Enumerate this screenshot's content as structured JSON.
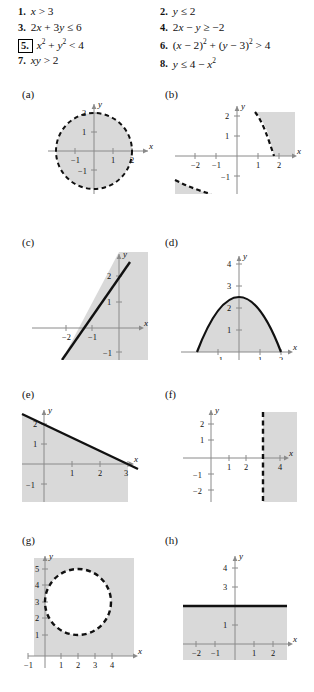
{
  "exercises": {
    "left": [
      {
        "num": "1.",
        "boxed": false,
        "text": "x > 3",
        "html": "<i class='ital'>x</i> &gt; 3"
      },
      {
        "num": "3.",
        "boxed": false,
        "text": "2x + 3y ≤ 6",
        "html": "2<i class='ital'>x</i> + 3<i class='ital'>y</i> ≤ 6"
      },
      {
        "num": "5.",
        "boxed": true,
        "text": "x² + y² < 4",
        "html": "<i class='ital'>x</i><sup>2</sup> + <i class='ital'>y</i><sup>2</sup> &lt; 4"
      },
      {
        "num": "7.",
        "boxed": false,
        "text": "xy > 2",
        "html": "<i class='ital'>xy</i> &gt; 2"
      }
    ],
    "right": [
      {
        "num": "2.",
        "boxed": false,
        "text": "y ≤ 2",
        "html": "<i class='ital'>y</i> ≤ 2"
      },
      {
        "num": "4.",
        "boxed": false,
        "text": "2x − y ≥ −2",
        "html": "2<i class='ital'>x</i> − <i class='ital'>y</i> ≥ −2"
      },
      {
        "num": "6.",
        "boxed": false,
        "text": "(x − 2)² + (y − 3)² > 4",
        "html": "(<i class='ital'>x</i> − 2)<sup>2</sup> + (<i class='ital'>y</i> − 3)<sup>2</sup> &gt; 4"
      },
      {
        "num": "8.",
        "boxed": false,
        "text": "y ≤ 4 − x²",
        "html": "<i class='ital'>y</i> ≤ 4 − <i class='ital'>x</i><sup>2</sup>"
      }
    ]
  },
  "axis_names": {
    "x": "x",
    "y": "y"
  },
  "colors": {
    "shade": "#d9d9d9",
    "curve": "#111111",
    "axis": "#8a8a8a",
    "text": "#111111"
  },
  "panels": [
    {
      "id": "a",
      "label": "(a)",
      "matches_exercise": "5",
      "chart_data": {
        "type": "region",
        "relation": "x^2 + y^2 < 4",
        "boundary": "dashed",
        "shape": "circle",
        "center": [
          0,
          0
        ],
        "radius": 2,
        "shaded": "interior",
        "xticks": [
          -1,
          1,
          2
        ],
        "yticks": [
          -1,
          1,
          2
        ],
        "xlabel": "x",
        "ylabel": "y"
      }
    },
    {
      "id": "b",
      "label": "(b)",
      "matches_exercise": "7",
      "chart_data": {
        "type": "region",
        "relation": "xy > 2",
        "boundary": "dashed",
        "shape": "hyperbola",
        "shaded": "above-right branch in Q1 and below-left branch in Q3",
        "xticks": [
          -2,
          -1,
          1,
          2
        ],
        "yticks": [
          -1,
          1,
          2
        ],
        "xlabel": "x",
        "ylabel": "y"
      }
    },
    {
      "id": "c",
      "label": "(c)",
      "matches_exercise": "4",
      "chart_data": {
        "type": "region",
        "relation": "2x - y >= -2",
        "boundary": "solid",
        "shape": "line",
        "line_points": [
          [
            -1,
            0
          ],
          [
            0,
            2
          ]
        ],
        "slope": 2,
        "intercept": 2,
        "shaded": "right of line",
        "xticks": [
          -2,
          -1
        ],
        "yticks": [
          -1,
          1,
          2
        ],
        "xlabel": "x",
        "ylabel": "y"
      }
    },
    {
      "id": "d",
      "label": "(d)",
      "matches_exercise": "8",
      "chart_data": {
        "type": "region",
        "relation": "y <= 4 - x^2",
        "boundary": "solid",
        "shape": "parabola",
        "vertex": [
          0,
          4
        ],
        "roots": [
          -2,
          2
        ],
        "shaded": "interior below parabola",
        "xticks": [
          -1,
          1,
          2
        ],
        "yticks": [
          1,
          2,
          3,
          4
        ],
        "xlabel": "x",
        "ylabel": "y"
      }
    },
    {
      "id": "e",
      "label": "(e)",
      "matches_exercise": "3",
      "chart_data": {
        "type": "region",
        "relation": "2x + 3y <= 6",
        "boundary": "solid",
        "shape": "line",
        "line_points": [
          [
            0,
            2
          ],
          [
            3,
            0
          ]
        ],
        "slope": -0.6667,
        "intercept": 2,
        "shaded": "below line",
        "xticks": [
          1,
          2,
          3
        ],
        "yticks": [
          -1,
          1,
          2
        ],
        "xlabel": "x",
        "ylabel": "y"
      }
    },
    {
      "id": "f",
      "label": "(f)",
      "matches_exercise": "1",
      "chart_data": {
        "type": "region",
        "relation": "x > 3",
        "boundary": "dashed",
        "shape": "vertical-line",
        "boundary_x": 3,
        "shaded": "right of x = 3",
        "xticks": [
          1,
          2,
          4
        ],
        "yticks": [
          -2,
          -1,
          1,
          2
        ],
        "xlabel": "x",
        "ylabel": "y"
      }
    },
    {
      "id": "g",
      "label": "(g)",
      "matches_exercise": "6",
      "chart_data": {
        "type": "region",
        "relation": "(x-2)^2 + (y-3)^2 > 4",
        "boundary": "dashed",
        "shape": "circle",
        "center": [
          2,
          3
        ],
        "radius": 2,
        "shaded": "exterior",
        "xticks": [
          -1,
          1,
          2,
          3,
          4
        ],
        "yticks": [
          1,
          2,
          3,
          4,
          5
        ],
        "xlabel": "x",
        "ylabel": "y"
      }
    },
    {
      "id": "h",
      "label": "(h)",
      "matches_exercise": "2",
      "chart_data": {
        "type": "region",
        "relation": "y <= 2",
        "boundary": "solid",
        "shape": "horizontal-line",
        "boundary_y": 2,
        "shaded": "below y = 2",
        "xticks": [
          -2,
          -1,
          1,
          2
        ],
        "yticks": [
          1,
          3,
          4
        ],
        "xlabel": "x",
        "ylabel": "y"
      }
    }
  ]
}
